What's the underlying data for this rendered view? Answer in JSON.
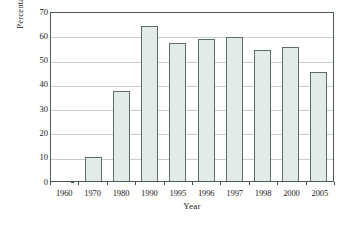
{
  "chart_data": {
    "type": "bar",
    "title": "",
    "xlabel": "Year",
    "ylabel": "Percentage",
    "categories": [
      "1960",
      "1970",
      "1980",
      "1990",
      "1995",
      "1996",
      "1997",
      "1998",
      "2000",
      "2005"
    ],
    "values": [
      0,
      10,
      37,
      64,
      57,
      58.5,
      59.5,
      54,
      55,
      45
    ],
    "ylim": [
      0,
      70
    ],
    "yticks": [
      0,
      10,
      20,
      30,
      40,
      50,
      60,
      70
    ],
    "ytick_labels": [
      "0",
      "10",
      "20",
      "30",
      "40",
      "50",
      "60",
      "70"
    ],
    "grid": true,
    "grid_axis": "y",
    "legend": false,
    "legend_position": "none",
    "bar_fill_color": "#e3ebe7",
    "bar_edge_color": "#5d6d66",
    "gridline_color": "#c8cecb",
    "frame_color": "#4a5a54",
    "background_color": "#ffffff"
  }
}
